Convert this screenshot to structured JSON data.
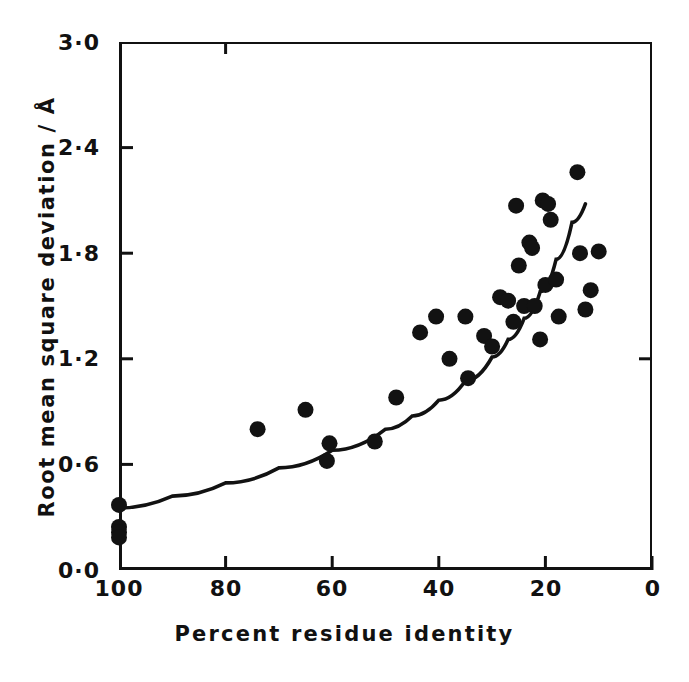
{
  "chart_data": {
    "type": "scatter",
    "title": "",
    "xlabel": "Percent residue identity",
    "ylabel": "Root mean square deviation / Å",
    "xlim": [
      100,
      0
    ],
    "ylim": [
      0.0,
      3.0
    ],
    "x_reversed": true,
    "grid": false,
    "legend": null,
    "xticks": [
      "100",
      "80",
      "60",
      "40",
      "20",
      "0"
    ],
    "xtick_values": [
      100,
      80,
      60,
      40,
      20,
      0
    ],
    "yticks": [
      "0·0",
      "0·6",
      "1·2",
      "1·8",
      "2·4",
      "3·0"
    ],
    "ytick_values": [
      0.0,
      0.6,
      1.2,
      1.8,
      2.4,
      3.0
    ],
    "series": [
      {
        "name": "Structure pairs",
        "marker": "filled-circle",
        "color": "#121212",
        "points": [
          [
            100.0,
            0.37
          ],
          [
            100.0,
            0.245
          ],
          [
            100.0,
            0.215
          ],
          [
            100.0,
            0.185
          ],
          [
            74.0,
            0.8
          ],
          [
            65.0,
            0.91
          ],
          [
            61.0,
            0.62
          ],
          [
            60.5,
            0.72
          ],
          [
            52.0,
            0.73
          ],
          [
            48.0,
            0.98
          ],
          [
            43.5,
            1.35
          ],
          [
            40.5,
            1.44
          ],
          [
            38.0,
            1.2
          ],
          [
            35.0,
            1.44
          ],
          [
            34.5,
            1.09
          ],
          [
            31.5,
            1.33
          ],
          [
            30.0,
            1.27
          ],
          [
            28.5,
            1.55
          ],
          [
            27.0,
            1.53
          ],
          [
            26.0,
            1.41
          ],
          [
            25.5,
            2.07
          ],
          [
            25.0,
            1.73
          ],
          [
            24.0,
            1.5
          ],
          [
            23.0,
            1.86
          ],
          [
            22.5,
            1.83
          ],
          [
            22.0,
            1.5
          ],
          [
            21.0,
            1.31
          ],
          [
            20.5,
            2.1
          ],
          [
            20.0,
            1.62
          ],
          [
            19.5,
            2.08
          ],
          [
            19.0,
            1.99
          ],
          [
            18.0,
            1.65
          ],
          [
            17.5,
            1.44
          ],
          [
            14.0,
            2.26
          ],
          [
            13.5,
            1.8
          ],
          [
            12.5,
            1.48
          ],
          [
            10.0,
            1.81
          ],
          [
            11.5,
            1.59
          ]
        ]
      }
    ],
    "fit_curve": {
      "name": "Fitted exponential trend",
      "color": "#121212",
      "points": [
        [
          100.0,
          0.352
        ],
        [
          90.0,
          0.42
        ],
        [
          80.0,
          0.495
        ],
        [
          70.0,
          0.58
        ],
        [
          60.0,
          0.68
        ],
        [
          50.0,
          0.8
        ],
        [
          45.0,
          0.875
        ],
        [
          40.0,
          0.965
        ],
        [
          35.0,
          1.075
        ],
        [
          30.0,
          1.21
        ],
        [
          27.0,
          1.31
        ],
        [
          24.0,
          1.43
        ],
        [
          21.0,
          1.58
        ],
        [
          18.0,
          1.765
        ],
        [
          15.0,
          1.975
        ],
        [
          12.5,
          2.08
        ]
      ]
    }
  },
  "figure": {
    "background_color": "#ffffff",
    "ink_color": "#121212",
    "marker_radius_px": 8
  }
}
